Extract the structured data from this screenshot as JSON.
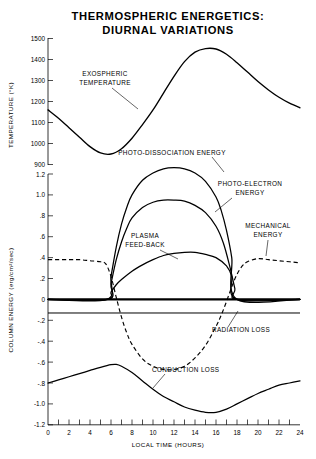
{
  "chart_data": {
    "type": "line",
    "title": "THERMOSPHERIC ENERGETICS: DIURNAL VARIATIONS",
    "title_line1": "THERMOSPHERIC ENERGETICS:",
    "title_line2": "DIURNAL VARIATIONS",
    "xlabel": "LOCAL TIME (HOURS)",
    "xlim": [
      0,
      24
    ],
    "xticks": [
      0,
      2,
      4,
      6,
      8,
      10,
      12,
      14,
      16,
      18,
      20,
      22,
      24
    ],
    "xtick_labels": [
      "0",
      "2",
      "4",
      "6",
      "8",
      "10",
      "12",
      "14",
      "16",
      "18",
      "20",
      "22",
      "24"
    ],
    "xminor_step": 1,
    "grid": false,
    "legend": "none (curves labelled inline with leader lines)",
    "panels": [
      {
        "name": "temperature",
        "ylabel": "TEMPERATURE (°K)",
        "ylim": [
          900,
          1500
        ],
        "yticks": [
          900,
          1000,
          1100,
          1200,
          1300,
          1400,
          1500
        ],
        "ytick_labels": [
          "900",
          "1000",
          "1100",
          "1200",
          "1300",
          "1400",
          "1500"
        ],
        "series": [
          {
            "name": "EXOSPHERIC TEMPERATURE",
            "style": "solid",
            "annotation": "EXOSPHERIC\nTEMPERATURE",
            "annotation_line1": "EXOSPHERIC",
            "annotation_line2": "TEMPERATURE",
            "x": [
              0,
              1,
              2,
              3,
              4,
              5,
              6,
              7,
              8,
              9,
              10,
              11,
              12,
              13,
              14,
              15,
              16,
              17,
              18,
              19,
              20,
              21,
              22,
              23,
              24
            ],
            "values": [
              1160,
              1120,
              1075,
              1030,
              985,
              955,
              950,
              975,
              1025,
              1090,
              1160,
              1240,
              1320,
              1390,
              1435,
              1452,
              1450,
              1425,
              1385,
              1340,
              1295,
              1255,
              1220,
              1192,
              1170
            ]
          }
        ]
      },
      {
        "name": "column_energy",
        "ylabel": "COLUMN ENERGY (erg/cm²/sec)",
        "ylim": [
          -1.2,
          1.3
        ],
        "yticks": [
          1.2,
          1.0,
          0.8,
          0.6,
          0.4,
          0.2,
          0,
          -0.2,
          -0.4,
          -0.6,
          -0.8,
          -1.0,
          -1.2
        ],
        "ytick_labels": [
          "1.2",
          "1.0",
          ".8",
          ".6",
          ".4",
          ".2",
          "0",
          "-.2",
          "-.4",
          "-.6",
          "-.8",
          "-1.0",
          "-1.2"
        ],
        "series": [
          {
            "name": "PHOTO-DISSOCIATION ENERGY",
            "style": "solid",
            "annotation": "PHOTO-DISSOCIATION ENERGY",
            "peak_value": 1.25,
            "peak_time": 12,
            "x": [
              0,
              5.6,
              6,
              6.5,
              7,
              7.5,
              8,
              9,
              10,
              11,
              12,
              13,
              14,
              15,
              16,
              16.5,
              17,
              17.5,
              18,
              24
            ],
            "values": [
              0,
              0,
              0.22,
              0.5,
              0.72,
              0.88,
              1.0,
              1.14,
              1.21,
              1.25,
              1.26,
              1.25,
              1.21,
              1.13,
              0.98,
              0.85,
              0.66,
              0.4,
              0,
              0
            ]
          },
          {
            "name": "PHOTO-ELECTRON ENERGY",
            "style": "solid",
            "annotation": "PHOTO-ELECTRON\nENERGY",
            "annotation_line1": "PHOTO-ELECTRON",
            "annotation_line2": "ENERGY",
            "peak_value": 0.95,
            "peak_time": 12,
            "x": [
              0,
              5.7,
              6,
              6.5,
              7,
              7.5,
              8,
              9,
              10,
              11,
              12,
              13,
              14,
              15,
              16,
              16.7,
              17.3,
              17.8,
              18,
              24
            ],
            "values": [
              0,
              0,
              0.15,
              0.38,
              0.55,
              0.68,
              0.78,
              0.88,
              0.93,
              0.95,
              0.95,
              0.94,
              0.9,
              0.83,
              0.7,
              0.54,
              0.32,
              0.1,
              0,
              0
            ]
          },
          {
            "name": "PLASMA FEED-BACK",
            "style": "solid",
            "annotation": "PLASMA\nFEED-BACK",
            "annotation_line1": "PLASMA",
            "annotation_line2": "FEED-BACK",
            "peak_value": 0.45,
            "peak_time": 13,
            "x": [
              0,
              5.6,
              6,
              6.5,
              7,
              8,
              9,
              10,
              11,
              12,
              13,
              14,
              15,
              16,
              17,
              17.5,
              18,
              24
            ],
            "values": [
              0,
              0,
              0.07,
              0.14,
              0.19,
              0.27,
              0.33,
              0.38,
              0.42,
              0.44,
              0.45,
              0.45,
              0.43,
              0.4,
              0.32,
              0.22,
              0,
              0
            ]
          },
          {
            "name": "MECHANICAL ENERGY",
            "style": "dashed",
            "annotation": "MECHANICAL\nENERGY",
            "annotation_line1": "MECHANICAL",
            "annotation_line2": "ENERGY",
            "x": [
              0,
              1,
              2,
              3,
              4,
              5,
              5.5,
              6,
              6.5,
              7,
              7.5,
              8,
              9,
              10,
              11,
              12,
              13,
              14,
              15,
              16,
              16.5,
              17,
              17.5,
              18,
              18.5,
              19,
              20,
              21,
              22,
              23,
              24
            ],
            "values": [
              0.38,
              0.38,
              0.38,
              0.38,
              0.37,
              0.36,
              0.34,
              0.22,
              0.02,
              -0.17,
              -0.32,
              -0.43,
              -0.57,
              -0.64,
              -0.67,
              -0.67,
              -0.64,
              -0.56,
              -0.44,
              -0.26,
              -0.15,
              -0.02,
              0.12,
              0.24,
              0.32,
              0.36,
              0.39,
              0.38,
              0.37,
              0.36,
              0.35
            ]
          },
          {
            "name": "RADIATION LOSS",
            "style": "solid",
            "annotation": "RADIATION LOSS",
            "constant_value": -0.13,
            "x": [
              0,
              24
            ],
            "values": [
              -0.13,
              -0.13
            ]
          },
          {
            "name": "ZERO BASELINE / SUM",
            "style": "solid-thick",
            "x": [
              0,
              24
            ],
            "values": [
              0,
              0
            ]
          },
          {
            "name": "CONDUCTION LOSS",
            "style": "solid",
            "annotation": "CONDUCTION LOSS",
            "x": [
              0,
              1,
              2,
              3,
              4,
              5,
              6,
              6.5,
              7,
              8,
              9,
              10,
              11,
              12,
              13,
              14,
              15,
              16,
              17,
              18,
              19,
              20,
              21,
              22,
              23,
              24
            ],
            "values": [
              -0.8,
              -0.77,
              -0.74,
              -0.71,
              -0.68,
              -0.65,
              -0.625,
              -0.622,
              -0.64,
              -0.7,
              -0.78,
              -0.86,
              -0.93,
              -0.98,
              -1.03,
              -1.06,
              -1.08,
              -1.08,
              -1.05,
              -1.0,
              -0.95,
              -0.9,
              -0.86,
              -0.82,
              -0.8,
              -0.78
            ]
          }
        ]
      }
    ],
    "annotations": [
      "EXOSPHERIC TEMPERATURE",
      "PHOTO-DISSOCIATION ENERGY",
      "PHOTO-ELECTRON ENERGY",
      "PLASMA FEED-BACK",
      "MECHANICAL ENERGY",
      "RADIATION LOSS",
      "CONDUCTION LOSS"
    ]
  },
  "labels": {
    "title_line1": "THERMOSPHERIC ENERGETICS:",
    "title_line2": "DIURNAL VARIATIONS",
    "xaxis": "LOCAL TIME (HOURS)",
    "yaxis_temperature": "TEMPERATURE (°K)",
    "yaxis_energy": "COLUMN ENERGY (erg/cm²/sec)",
    "ann_exospheric_1": "EXOSPHERIC",
    "ann_exospheric_2": "TEMPERATURE",
    "ann_photodiss": "PHOTO-DISSOCIATION ENERGY",
    "ann_photoelec_1": "PHOTO-ELECTRON",
    "ann_photoelec_2": "ENERGY",
    "ann_plasma_1": "PLASMA",
    "ann_plasma_2": "FEED-BACK",
    "ann_mech_1": "MECHANICAL",
    "ann_mech_2": "ENERGY",
    "ann_radiation": "RADIATION LOSS",
    "ann_conduction": "CONDUCTION LOSS"
  },
  "ticks": {
    "temp": [
      "1500",
      "1400",
      "1300",
      "1200",
      "1100",
      "1000",
      "900"
    ],
    "energy": [
      "1.2",
      "1.0",
      ".8",
      ".6",
      ".4",
      ".2",
      "0",
      "-.2",
      "-.4",
      "-.6",
      "-.8",
      "-1.0",
      "-1.2"
    ],
    "time": [
      "0",
      "2",
      "4",
      "6",
      "8",
      "10",
      "12",
      "14",
      "16",
      "18",
      "20",
      "22",
      "24"
    ]
  },
  "colors": {
    "background": "#ffffff",
    "ink": "#000000"
  }
}
